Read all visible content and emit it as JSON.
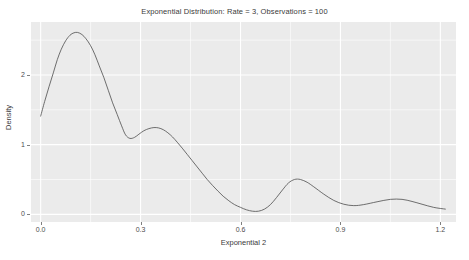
{
  "chart_data": {
    "type": "line",
    "title": "Exponential Distribution: Rate = 3, Observations = 100",
    "xlabel": "Exponential 2",
    "ylabel": "Density",
    "xlim": [
      -0.029,
      1.247
    ],
    "ylim": [
      -0.11,
      2.76
    ],
    "xticks": [
      0.0,
      0.3,
      0.6,
      0.9,
      1.2
    ],
    "xtick_labels": [
      "0.0",
      "0.3",
      "0.6",
      "0.9",
      "1.2"
    ],
    "yticks": [
      0,
      1,
      2
    ],
    "ytick_labels": [
      "0",
      "1",
      "2"
    ],
    "grid": true,
    "grid_color": "#ffffff",
    "panel_color": "#ebebeb",
    "legend": null,
    "series": [
      {
        "name": "density",
        "line_color": "#4d4d4d",
        "line_width": 0.8,
        "x": [
          0.0,
          0.012,
          0.025,
          0.038,
          0.05,
          0.062,
          0.075,
          0.088,
          0.1,
          0.111,
          0.124,
          0.136,
          0.15,
          0.163,
          0.176,
          0.19,
          0.203,
          0.216,
          0.23,
          0.243,
          0.255,
          0.268,
          0.282,
          0.295,
          0.31,
          0.325,
          0.34,
          0.354,
          0.368,
          0.382,
          0.396,
          0.41,
          0.425,
          0.44,
          0.455,
          0.47,
          0.485,
          0.5,
          0.516,
          0.532,
          0.548,
          0.565,
          0.582,
          0.6,
          0.618,
          0.636,
          0.654,
          0.672,
          0.69,
          0.708,
          0.726,
          0.744,
          0.762,
          0.78,
          0.8,
          0.82,
          0.85,
          0.88,
          0.91,
          0.94,
          0.97,
          1.01,
          1.05,
          1.085,
          1.115,
          1.145,
          1.18,
          1.215
        ],
        "y": [
          1.41,
          1.62,
          1.83,
          2.03,
          2.22,
          2.37,
          2.49,
          2.57,
          2.605,
          2.61,
          2.58,
          2.52,
          2.42,
          2.29,
          2.13,
          1.96,
          1.78,
          1.6,
          1.43,
          1.27,
          1.14,
          1.09,
          1.105,
          1.15,
          1.2,
          1.23,
          1.245,
          1.24,
          1.215,
          1.17,
          1.11,
          1.035,
          0.95,
          0.86,
          0.77,
          0.68,
          0.59,
          0.5,
          0.415,
          0.335,
          0.26,
          0.195,
          0.14,
          0.1,
          0.065,
          0.045,
          0.045,
          0.075,
          0.14,
          0.24,
          0.35,
          0.45,
          0.5,
          0.5,
          0.46,
          0.395,
          0.29,
          0.2,
          0.145,
          0.125,
          0.14,
          0.18,
          0.215,
          0.215,
          0.185,
          0.145,
          0.1,
          0.075
        ]
      }
    ]
  }
}
